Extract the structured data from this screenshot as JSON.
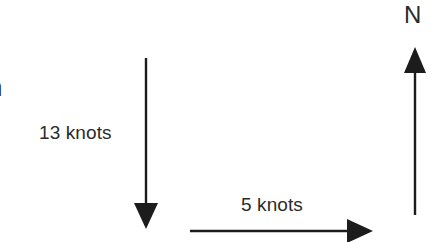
{
  "diagram": {
    "type": "vector-diagram",
    "background_color": "#ffffff",
    "stroke_color": "#1c1c1c",
    "text_color": "#2b2b2b",
    "vectors": [
      {
        "name": "vertical-velocity-vector",
        "label": "13 knots",
        "magnitude": 13,
        "unit": "knots",
        "direction": "down",
        "x1": 146,
        "y1": 58,
        "x2": 146,
        "y2": 228
      },
      {
        "name": "horizontal-velocity-vector",
        "label": "5 knots",
        "magnitude": 5,
        "unit": "knots",
        "direction": "right",
        "x1": 190,
        "y1": 231,
        "x2": 372,
        "y2": 231
      },
      {
        "name": "north-reference-arrow",
        "label": "N",
        "direction": "up",
        "x1": 415,
        "y1": 215,
        "x2": 415,
        "y2": 48
      }
    ],
    "labels": {
      "vertical_speed": "13 knots",
      "horizontal_speed": "5 knots",
      "north": "N"
    },
    "clipped_text": {
      "upper": "n",
      "lower": "l"
    }
  }
}
